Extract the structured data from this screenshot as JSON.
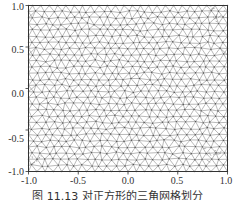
{
  "chart_data": {
    "type": "scatter",
    "subtype": "triangular-mesh",
    "title": "",
    "xlabel": "",
    "ylabel": "",
    "xlim": [
      -1.0,
      1.0
    ],
    "ylim": [
      -1.0,
      1.0
    ],
    "xticks": [
      "-1.0",
      "-0.5",
      "0.0",
      "0.5",
      "1.0"
    ],
    "yticks": [
      "1.0",
      "0.5",
      "0.0",
      "-0.5",
      "-1.0"
    ],
    "grid": false,
    "legend": null,
    "mesh": {
      "description": "Unstructured triangular mesh on the square [-1,1]x[-1,1], roughly uniform spacing with refined clusters near corners",
      "approx_spacing": 0.085,
      "refined_regions": [
        {
          "x": 0.9,
          "y": 0.9
        },
        {
          "x": -0.95,
          "y": -0.85
        },
        {
          "x": 0.85,
          "y": -0.8
        }
      ]
    },
    "caption": "图 11.13  对正方形的三角网格划分"
  },
  "axes": {
    "frame_color": "#333333",
    "mesh_color": "#8a8a8a",
    "node_color": "#555555"
  }
}
